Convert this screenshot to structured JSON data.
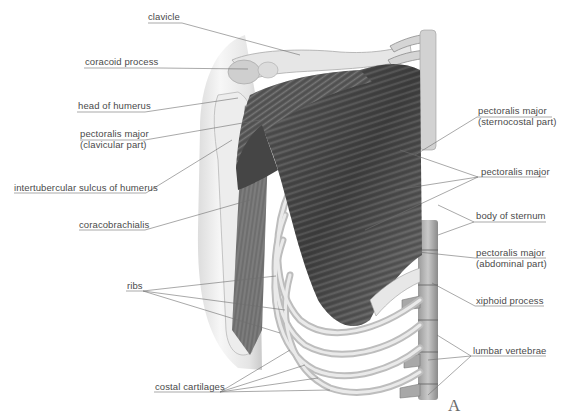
{
  "figure": {
    "plate_letter": "A",
    "colors": {
      "background": "#ffffff",
      "label_text": "#4a4a4a",
      "leader_line": "#6e6e6e",
      "muscle_dark": "#3c3c3c",
      "muscle_mid": "#7a7a7a",
      "bone_light": "#e4e4e4",
      "bone_shadow": "#b5b5b5"
    }
  },
  "labels_left": [
    {
      "id": "clavicle",
      "text": "clavicle"
    },
    {
      "id": "coracoid-process",
      "text": "coracoid process"
    },
    {
      "id": "head-of-humerus",
      "text": "head of humerus"
    },
    {
      "id": "pectoralis-major-clavicular",
      "text": "pectoralis major",
      "text2": "(clavicular part)"
    },
    {
      "id": "intertubercular-sulcus",
      "text": "intertubercular sulcus of humerus"
    },
    {
      "id": "coracobrachialis",
      "text": "coracobrachialis"
    },
    {
      "id": "ribs",
      "text": "ribs"
    },
    {
      "id": "costal-cartilages",
      "text": "costal cartilages"
    }
  ],
  "labels_right": [
    {
      "id": "pectoralis-major-sternocostal",
      "text": "pectoralis major",
      "text2": "(sternocostal part)"
    },
    {
      "id": "pectoralis-major",
      "text": "pectoralis major"
    },
    {
      "id": "body-of-sternum",
      "text": "body of sternum"
    },
    {
      "id": "pectoralis-major-abdominal",
      "text": "pectoralis major",
      "text2": "(abdominal part)"
    },
    {
      "id": "xiphoid-process",
      "text": "xiphoid process"
    },
    {
      "id": "lumbar-vertebrae",
      "text": "lumbar vertebrae"
    }
  ]
}
